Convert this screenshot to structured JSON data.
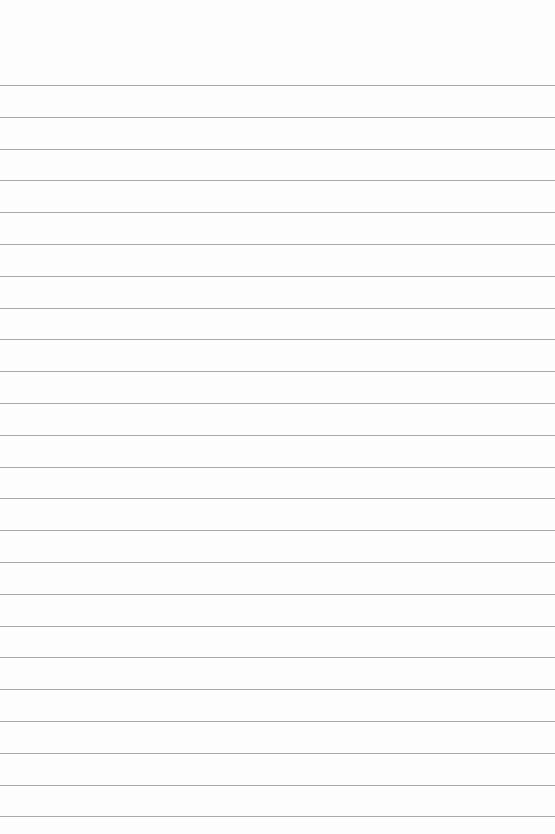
{
  "page": {
    "type": "lined-paper",
    "background_color": "#fdfdfd",
    "line_color": "#a9a9a9",
    "first_line_y": 85,
    "line_spacing": 31.8,
    "line_count": 24
  }
}
